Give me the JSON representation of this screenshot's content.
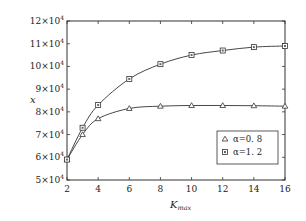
{
  "chart_data": {
    "type": "line",
    "title": "",
    "xlabel": "K_max",
    "xlabel_main": "K",
    "xlabel_sub": "max",
    "ylabel": "x",
    "xlim": [
      2,
      16
    ],
    "ylim": [
      50000,
      120000
    ],
    "x_ticks": [
      2,
      4,
      6,
      8,
      10,
      12,
      14,
      16
    ],
    "y_ticks": [
      50000,
      60000,
      70000,
      80000,
      90000,
      100000,
      110000,
      120000
    ],
    "y_tick_labels": [
      {
        "mant": "5×10",
        "exp": "4"
      },
      {
        "mant": "6×10",
        "exp": "4"
      },
      {
        "mant": "7×10",
        "exp": "4"
      },
      {
        "mant": "8×10",
        "exp": "4"
      },
      {
        "mant": "9×10",
        "exp": "4"
      },
      {
        "mant": "10×10",
        "exp": "4"
      },
      {
        "mant": "11×10",
        "exp": "4"
      },
      {
        "mant": "12×10",
        "exp": "4"
      }
    ],
    "grid": false,
    "legend_position": "lower right",
    "x": [
      2,
      3,
      4,
      6,
      8,
      10,
      12,
      14,
      16
    ],
    "series": [
      {
        "name": "α=0. 8",
        "marker": "triangle",
        "values": [
          59000,
          70000,
          77000,
          81500,
          82500,
          82800,
          82800,
          82700,
          82500
        ]
      },
      {
        "name": "α=1. 2",
        "marker": "square",
        "values": [
          59000,
          73000,
          83000,
          94500,
          101000,
          105000,
          107000,
          108500,
          109000
        ]
      }
    ]
  },
  "legend": {
    "items": [
      {
        "label": "α=0. 8",
        "marker": "triangle"
      },
      {
        "label": "α=1. 2",
        "marker": "square"
      }
    ]
  }
}
